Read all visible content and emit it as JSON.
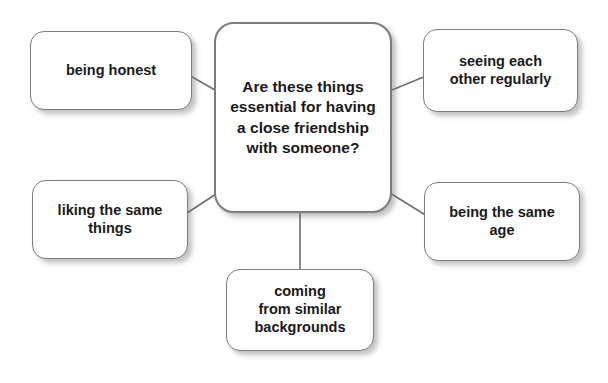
{
  "diagram": {
    "type": "mind-map",
    "background_color": "#ffffff",
    "node_fill_color": "#ffffff",
    "node_border_color": "#7d7d7d",
    "connector_color": "#6e6e6e",
    "text_color": "#1a1a1a",
    "center": {
      "id": "center",
      "label": "Are these things essential for having a close friendship with someone?"
    },
    "branches": [
      {
        "id": "being-honest",
        "label": "being honest"
      },
      {
        "id": "seeing-each-other-regularly",
        "label": "seeing each\nother regularly"
      },
      {
        "id": "liking-the-same-things",
        "label": "liking the same\nthings"
      },
      {
        "id": "being-the-same-age",
        "label": "being the same\nage"
      },
      {
        "id": "coming-from-similar-backgrounds",
        "label": "coming\nfrom similar\nbackgrounds"
      }
    ],
    "connectors": [
      {
        "from": "being-honest",
        "to": "center",
        "x1": 180,
        "y1": 70,
        "x2": 215,
        "y2": 90
      },
      {
        "from": "center",
        "to": "seeing-each-other-regularly",
        "x1": 392,
        "y1": 90,
        "x2": 426,
        "y2": 76
      },
      {
        "from": "liking-the-same-things",
        "to": "center",
        "x1": 184,
        "y1": 215,
        "x2": 216,
        "y2": 194
      },
      {
        "from": "center",
        "to": "being-the-same-age",
        "x1": 390,
        "y1": 193,
        "x2": 427,
        "y2": 216
      },
      {
        "from": "center",
        "to": "coming-from-similar-backgrounds",
        "x1": 300,
        "y1": 213,
        "x2": 300,
        "y2": 270
      }
    ]
  }
}
